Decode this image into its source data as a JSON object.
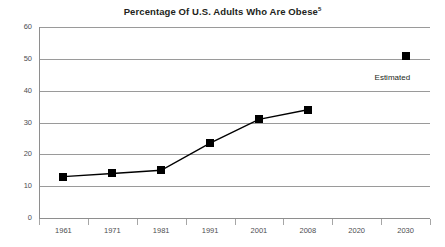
{
  "chart_data": {
    "type": "line",
    "title": "Percentage Of U.S. Adults Who Are Obese",
    "title_superscript": "5",
    "xlabel": "",
    "ylabel": "",
    "categories": [
      "1961",
      "1971",
      "1981",
      "1991",
      "2001",
      "2008",
      "2020",
      "2030"
    ],
    "x_tick_labels": [
      "1961",
      "1971",
      "1981",
      "1991",
      "2001",
      "2008",
      "2020",
      "2030"
    ],
    "y_tick_labels": [
      "0",
      "10",
      "20",
      "30",
      "40",
      "50",
      "60"
    ],
    "y_ticks": [
      0,
      10,
      20,
      30,
      40,
      50,
      60
    ],
    "ylim": [
      0,
      60
    ],
    "grid": "horizontal",
    "legend": "none",
    "series": [
      {
        "name": "Percentage of U.S. adults who are obese",
        "points": [
          {
            "x": "1961",
            "y": 13
          },
          {
            "x": "1971",
            "y": 14
          },
          {
            "x": "1981",
            "y": 15
          },
          {
            "x": "1991",
            "y": 23.5
          },
          {
            "x": "2001",
            "y": 31
          },
          {
            "x": "2008",
            "y": 34
          }
        ],
        "marker": "square",
        "color": "#000000"
      },
      {
        "name": "Estimated",
        "points": [
          {
            "x": "2030",
            "y": 51
          }
        ],
        "marker": "square",
        "color": "#000000",
        "connected": false
      }
    ],
    "annotations": [
      {
        "text": "Estimated",
        "x": "2030",
        "y": 44
      }
    ]
  },
  "annotations": {
    "estimated_label": "Estimated"
  },
  "colors": {
    "series": "#000000",
    "gridline": "#9a9a9a",
    "axis": "#8e8e8e",
    "text": "#231f20",
    "tick_text": "#4d4d4f",
    "background": "#ffffff"
  }
}
